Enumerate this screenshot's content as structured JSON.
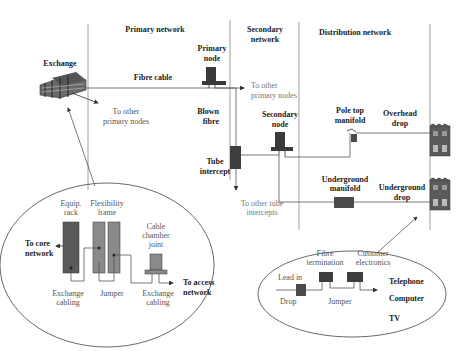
{
  "sections": {
    "primary": "Primary network",
    "secondary_1": "Secondary",
    "secondary_2": "network",
    "distribution": "Distribution network"
  },
  "labels": {
    "exchange": "Exchange",
    "primary_node_1": "Primary",
    "primary_node_2": "node",
    "fibre_cable": "Fibre cable",
    "to_other_primary_1_a": "To other",
    "to_other_primary_1_b": "primary nodes",
    "to_other_primary_2_a": "To other",
    "to_other_primary_2_b": "primary nodes",
    "blown_fibre_1": "Blown",
    "blown_fibre_2": "fibre",
    "tube_intercept_1": "Tube",
    "tube_intercept_2": "intercept",
    "to_other_tube_1": "To other tube",
    "to_other_tube_2": "intercepts",
    "secondary_node_1": "Secondary",
    "secondary_node_2": "node",
    "pole_top_1": "Pole top",
    "pole_top_2": "manifold",
    "overhead_1": "Overhead",
    "overhead_2": "drop",
    "ug_manifold_1": "Underground",
    "ug_manifold_2": "manifold",
    "ug_drop_1": "Underground",
    "ug_drop_2": "drop"
  },
  "exchange_detail": {
    "equip_1": "Equip.",
    "equip_2": "rack",
    "flex_1": "Flexibility",
    "flex_2": "frame",
    "chamber_1": "Cable",
    "chamber_2": "chamber",
    "chamber_3": "joint",
    "core_1": "To core",
    "core_2": "network",
    "access_1": "To access",
    "access_2": "network",
    "exch_cab_1a": "Exchange",
    "exch_cab_1b": "cabling",
    "jumper": "Jumper",
    "exch_cab_2a": "Exchange",
    "exch_cab_2b": "cabling"
  },
  "customer_detail": {
    "fibre_term_1": "Fibre",
    "fibre_term_2": "termination",
    "cust_elec_1": "Customer",
    "cust_elec_2": "electronics",
    "lead_in": "Lead in",
    "drop": "Drop",
    "jumper": "Jumper",
    "telephone": "Telephone",
    "computer": "Computer",
    "tv": "TV"
  },
  "colors": {
    "dark_fill": "#4a4a4a",
    "mid_fill": "#8a8a8a",
    "line": "#555555"
  }
}
